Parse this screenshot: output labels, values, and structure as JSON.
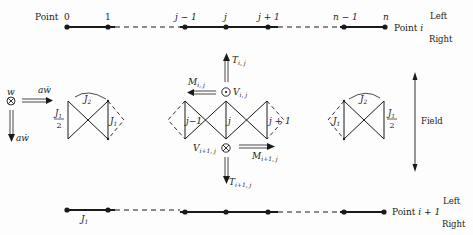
{
  "figure": {
    "top_chain": {
      "start_label": "Point",
      "point_labels": [
        "0",
        "1",
        "j − 1",
        "j",
        "j + 1",
        "n − 1",
        "n"
      ],
      "end_label_prefix": "Point",
      "end_label_var": "i",
      "side_left": "Left",
      "side_right": "Right"
    },
    "bottom_chain": {
      "bond_label": "J",
      "bond_sub": "1",
      "end_label_prefix": "Point",
      "end_label_var": "i + 1",
      "side_left": "Left",
      "side_right": "Right"
    },
    "left_unit": {
      "w_label": "w",
      "aw_right": "aẇ",
      "aw_down": "aẇ",
      "half_j1_num": "J",
      "half_j1_num_sub": "1",
      "half_j1_den": "2",
      "j2_label": "J",
      "j2_sub": "2",
      "j1_label": "J",
      "j1_sub": "1"
    },
    "center_unit": {
      "T_top": "T",
      "T_top_sub": "i, j",
      "M_top": "M",
      "M_top_sub": "i, j",
      "V_top": "V",
      "V_top_sub": "i, j",
      "col_labels": [
        "j−1",
        "j",
        "j + 1"
      ],
      "V_bot": "V",
      "V_bot_sub": "i+1, j",
      "M_bot": "M",
      "M_bot_sub": "i+1, j",
      "T_bot": "T",
      "T_bot_sub": "i+1, j"
    },
    "right_unit": {
      "j2_label": "J",
      "j2_sub": "2",
      "j1_label": "J",
      "j1_sub": "1",
      "half_j1_num": "J",
      "half_j1_num_sub": "1",
      "half_j1_den": "2"
    },
    "field_label": "Field",
    "colors": {
      "ink": "#1a1a1a",
      "background": "#fdfdfd"
    }
  }
}
